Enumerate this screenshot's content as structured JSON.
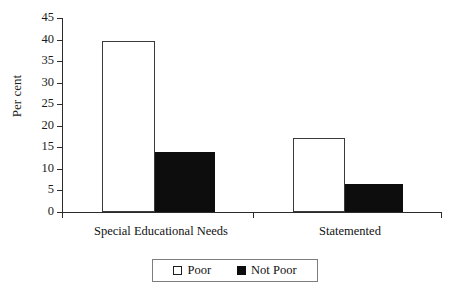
{
  "chart_data": {
    "type": "bar",
    "title": "",
    "subtitle": "",
    "xlabel": "",
    "ylabel": "Per cent",
    "ylim": [
      0,
      45
    ],
    "yticks": [
      0,
      5,
      10,
      15,
      20,
      25,
      30,
      35,
      40,
      45
    ],
    "ytick_labels": [
      "0",
      "5",
      "10",
      "15",
      "20",
      "25",
      "30",
      "35",
      "40",
      "45"
    ],
    "grid": false,
    "legend_position": "bottom-center",
    "categories": [
      "Special Educational Needs",
      "Statemented"
    ],
    "series": [
      {
        "name": "Poor",
        "values": [
          39.7,
          17.2
        ],
        "color": "#ffffff",
        "edge_color": "#3a3a3a",
        "swatch": "open-square"
      },
      {
        "name": "Not Poor",
        "values": [
          13.9,
          6.5
        ],
        "color": "#0d0d0d",
        "edge_color": "#0d0d0d",
        "swatch": "filled-square"
      }
    ],
    "annotations": []
  },
  "axis": {
    "y_title": "Per cent",
    "ticks": [
      {
        "label": "45",
        "value": 45
      },
      {
        "label": "40",
        "value": 40
      },
      {
        "label": "35",
        "value": 35
      },
      {
        "label": "30",
        "value": 30
      },
      {
        "label": "25",
        "value": 25
      },
      {
        "label": "20",
        "value": 20
      },
      {
        "label": "15",
        "value": 15
      },
      {
        "label": "10",
        "value": 10
      },
      {
        "label": "5",
        "value": 5
      },
      {
        "label": "0",
        "value": 0
      }
    ]
  },
  "categories": [
    {
      "label": "Special Educational Needs"
    },
    {
      "label": "Statemented"
    }
  ],
  "legend": {
    "entries": [
      {
        "label": "Poor",
        "swatch": "open-square"
      },
      {
        "label": "Not Poor",
        "swatch": "filled-square"
      }
    ]
  }
}
